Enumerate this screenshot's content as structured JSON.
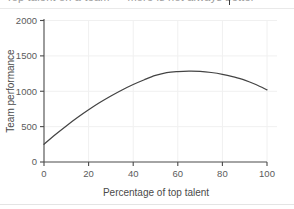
{
  "page": {
    "truncated_top_text": "Top talent on a team — more is not always better",
    "background_color": "#ffffff"
  },
  "chart_data": {
    "type": "line",
    "title": "",
    "xlabel": "Percentage of top talent",
    "ylabel": "Team performance",
    "xlim": [
      0,
      100
    ],
    "ylim": [
      0,
      2000
    ],
    "xticks": [
      0,
      20,
      40,
      60,
      80,
      100
    ],
    "yticks": [
      0,
      500,
      1000,
      1500,
      2000
    ],
    "xticklabels": [
      "0",
      "20",
      "40",
      "60",
      "80",
      "100"
    ],
    "yticklabels": [
      "0",
      "500",
      "1000",
      "1500",
      "2000"
    ],
    "grid": true,
    "legend": null,
    "line_color": "#444444",
    "series": [
      {
        "name": "Team performance",
        "x": [
          0,
          5,
          10,
          15,
          20,
          25,
          30,
          35,
          40,
          45,
          50,
          55,
          60,
          65,
          70,
          75,
          80,
          85,
          90,
          95,
          100
        ],
        "values": [
          250,
          385,
          510,
          628,
          738,
          840,
          933,
          1018,
          1095,
          1163,
          1223,
          1263,
          1278,
          1283,
          1280,
          1265,
          1240,
          1203,
          1158,
          1095,
          1020
        ]
      }
    ],
    "annotations": {
      "peak_x": 68,
      "peak_y": 1283,
      "start_y": 250,
      "end_y": 1020,
      "shape": "inverted-u"
    }
  }
}
